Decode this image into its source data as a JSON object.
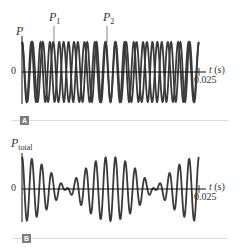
{
  "figure": {
    "panels": [
      {
        "id": "A",
        "badge": "A",
        "y_label": "P",
        "curve_labels": [
          {
            "name": "P",
            "sub": "1"
          },
          {
            "name": "P",
            "sub": "2"
          }
        ],
        "zero_label": "0",
        "x_axis_label": "t (s)",
        "x_tick_label": "0.025"
      },
      {
        "id": "B",
        "badge": "B",
        "y_label": "P",
        "y_label_sub": "total",
        "zero_label": "0",
        "x_axis_label": "t (s)",
        "x_tick_label": "0.025"
      }
    ],
    "colors": {
      "curve": "#3a3a3a",
      "axis": "#111111",
      "badge": "#7d7d7d",
      "rule": "#dcdcdc"
    }
  },
  "chart_data": [
    {
      "type": "line",
      "title": "A",
      "xlabel": "t (s)",
      "ylabel": "P",
      "xlim": [
        0,
        0.025
      ],
      "x_ticks": [
        "0",
        "0.025"
      ],
      "series": [
        {
          "name": "P1",
          "amplitude": 1,
          "frequency_hz": 760,
          "description": "sinusoidal pressure wave 1"
        },
        {
          "name": "P2",
          "amplitude": 1,
          "frequency_hz": 680,
          "description": "sinusoidal pressure wave 2, slightly lower frequency"
        }
      ],
      "grid": false
    },
    {
      "type": "line",
      "title": "B",
      "xlabel": "t (s)",
      "ylabel": "P_total",
      "xlim": [
        0,
        0.025
      ],
      "x_ticks": [
        "0",
        "0.025"
      ],
      "series": [
        {
          "name": "P_total = P1 + P2",
          "description": "superposition showing beats; envelope max at t≈0, t≈0.0125, t≈0.025; minima near t≈0.006 and t≈0.019"
        }
      ],
      "beat_frequency_hz": 80,
      "grid": false
    }
  ]
}
